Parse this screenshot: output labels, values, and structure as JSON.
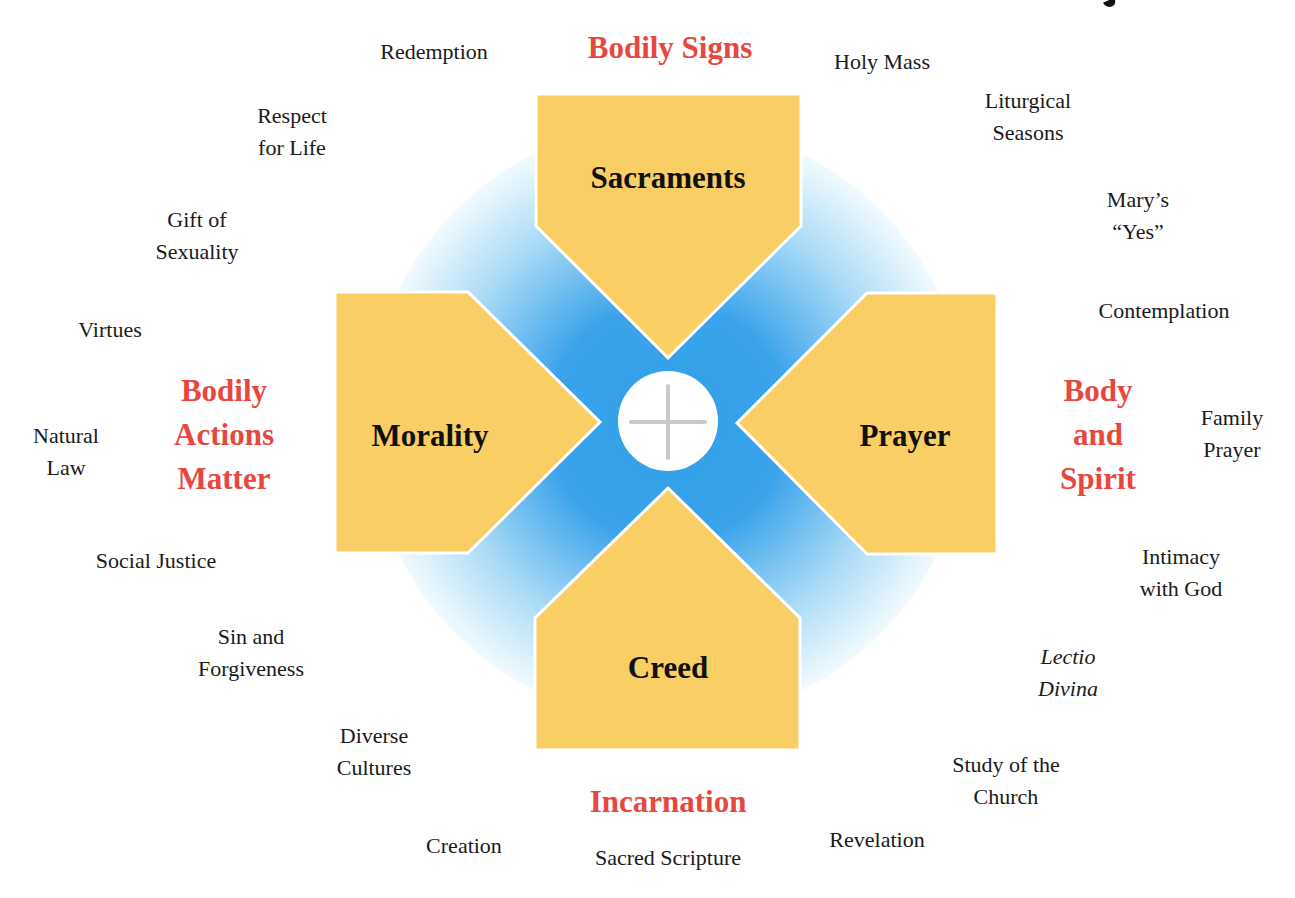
{
  "colors": {
    "pillar_fill": "#f9cf65",
    "pillar_outline": "#ffffff",
    "glow_center": "#2f9fe8",
    "theme_text": "#e8473f",
    "body_text": "#1a1a1a",
    "cross": "#c9c9c9"
  },
  "center": {
    "icon": "cross-icon"
  },
  "pillars": {
    "top": {
      "label": "Sacraments"
    },
    "left": {
      "label": "Morality"
    },
    "right": {
      "label": "Prayer"
    },
    "bottom": {
      "label": "Creed"
    }
  },
  "themes": {
    "top": {
      "lines": [
        "Bodily Signs"
      ]
    },
    "left": {
      "lines": [
        "Bodily",
        "Actions",
        "Matter"
      ]
    },
    "right": {
      "lines": [
        "Body",
        "and",
        "Spirit"
      ]
    },
    "bottom": {
      "lines": [
        "Incarnation"
      ]
    }
  },
  "topics": [
    {
      "id": "redemption",
      "lines": [
        "Redemption"
      ]
    },
    {
      "id": "holy-mass",
      "lines": [
        "Holy Mass"
      ]
    },
    {
      "id": "liturgical-seasons",
      "lines": [
        "Liturgical",
        "Seasons"
      ]
    },
    {
      "id": "respect-for-life",
      "lines": [
        "Respect",
        "for Life"
      ]
    },
    {
      "id": "marys-yes",
      "lines": [
        "Mary’s",
        "“Yes”"
      ]
    },
    {
      "id": "gift-of-sexuality",
      "lines": [
        "Gift of",
        "Sexuality"
      ]
    },
    {
      "id": "contemplation",
      "lines": [
        "Contemplation"
      ]
    },
    {
      "id": "virtues",
      "lines": [
        "Virtues"
      ]
    },
    {
      "id": "natural-law",
      "lines": [
        "Natural",
        "Law"
      ]
    },
    {
      "id": "family-prayer",
      "lines": [
        "Family",
        "Prayer"
      ]
    },
    {
      "id": "social-justice",
      "lines": [
        "Social Justice"
      ]
    },
    {
      "id": "intimacy-with-god",
      "lines": [
        "Intimacy",
        "with God"
      ]
    },
    {
      "id": "sin-and-forgiveness",
      "lines": [
        "Sin and",
        "Forgiveness"
      ]
    },
    {
      "id": "lectio-divina",
      "lines": [
        "Lectio",
        "Divina"
      ]
    },
    {
      "id": "diverse-cultures",
      "lines": [
        "Diverse",
        "Cultures"
      ]
    },
    {
      "id": "study-of-the-church",
      "lines": [
        "Study of the",
        "Church"
      ]
    },
    {
      "id": "creation",
      "lines": [
        "Creation"
      ]
    },
    {
      "id": "sacred-scripture",
      "lines": [
        "Sacred Scripture"
      ]
    },
    {
      "id": "revelation",
      "lines": [
        "Revelation"
      ]
    }
  ]
}
